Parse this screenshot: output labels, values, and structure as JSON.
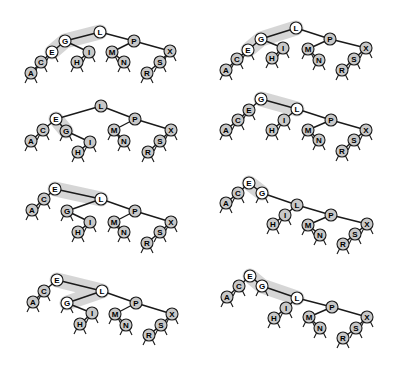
{
  "diagram": {
    "title": "",
    "colors": {
      "node_gray": "#c8c8c8",
      "node_white": "#ffffff",
      "edge": "#1a1a1a",
      "highlight": "#cfcfcf",
      "background": "#ffffff"
    },
    "panels": [
      {
        "id": "panel-1",
        "highlight_path": [
          "E",
          "G",
          "L"
        ],
        "nodes": {
          "L": [
            100,
            32,
            1
          ],
          "G": [
            65,
            41,
            1
          ],
          "E": [
            52,
            52,
            1
          ],
          "C": [
            41,
            62,
            0
          ],
          "A": [
            31,
            73,
            0
          ],
          "I": [
            89,
            52,
            0
          ],
          "H": [
            77,
            62,
            0
          ],
          "P": [
            134,
            41,
            0
          ],
          "M": [
            112,
            52,
            0
          ],
          "N": [
            124,
            62,
            0
          ],
          "X": [
            170,
            51,
            0
          ],
          "S": [
            160,
            62,
            0
          ],
          "R": [
            147,
            73,
            0
          ]
        },
        "edges": [
          [
            "L",
            "G"
          ],
          [
            "G",
            "E"
          ],
          [
            "E",
            "C"
          ],
          [
            "C",
            "A"
          ],
          [
            "G",
            "I"
          ],
          [
            "I",
            "H"
          ],
          [
            "L",
            "P"
          ],
          [
            "P",
            "M"
          ],
          [
            "M",
            "N"
          ],
          [
            "P",
            "X"
          ],
          [
            "X",
            "S"
          ],
          [
            "S",
            "R"
          ]
        ],
        "leaves": [
          "A",
          "C",
          "E",
          "H",
          "I",
          "M",
          "N",
          "R",
          "S",
          "X"
        ]
      },
      {
        "id": "panel-2",
        "highlight_path": [
          "E",
          "G",
          "L"
        ],
        "nodes": {
          "L": [
            296,
            28,
            1
          ],
          "G": [
            261,
            39,
            1
          ],
          "E": [
            248,
            50,
            1
          ],
          "C": [
            237,
            59,
            0
          ],
          "A": [
            226,
            70,
            0
          ],
          "I": [
            283,
            48,
            0
          ],
          "H": [
            272,
            58,
            0
          ],
          "P": [
            330,
            39,
            0
          ],
          "M": [
            308,
            49,
            0
          ],
          "N": [
            319,
            60,
            0
          ],
          "X": [
            366,
            48,
            0
          ],
          "S": [
            354,
            59,
            0
          ],
          "R": [
            342,
            70,
            0
          ]
        },
        "edges": [
          [
            "L",
            "G"
          ],
          [
            "G",
            "E"
          ],
          [
            "E",
            "C"
          ],
          [
            "C",
            "A"
          ],
          [
            "G",
            "I"
          ],
          [
            "I",
            "H"
          ],
          [
            "L",
            "P"
          ],
          [
            "P",
            "M"
          ],
          [
            "M",
            "N"
          ],
          [
            "P",
            "X"
          ],
          [
            "X",
            "S"
          ],
          [
            "S",
            "R"
          ]
        ],
        "leaves": [
          "A",
          "C",
          "E",
          "H",
          "I",
          "M",
          "N",
          "R",
          "S",
          "X"
        ]
      },
      {
        "id": "panel-3",
        "highlight_path": [
          "E",
          "G"
        ],
        "nodes": {
          "L": [
            101,
            106,
            0
          ],
          "E": [
            56,
            119,
            1
          ],
          "C": [
            43,
            130,
            0
          ],
          "A": [
            31,
            141,
            0
          ],
          "G": [
            66,
            131,
            0
          ],
          "I": [
            90,
            142,
            0
          ],
          "H": [
            78,
            152,
            0
          ],
          "P": [
            135,
            119,
            0
          ],
          "M": [
            114,
            130,
            0
          ],
          "N": [
            124,
            141,
            0
          ],
          "X": [
            171,
            130,
            0
          ],
          "S": [
            160,
            141,
            0
          ],
          "R": [
            148,
            152,
            0
          ]
        },
        "edges": [
          [
            "L",
            "E"
          ],
          [
            "E",
            "C"
          ],
          [
            "C",
            "A"
          ],
          [
            "E",
            "G"
          ],
          [
            "G",
            "I"
          ],
          [
            "I",
            "H"
          ],
          [
            "L",
            "P"
          ],
          [
            "P",
            "M"
          ],
          [
            "M",
            "N"
          ],
          [
            "P",
            "X"
          ],
          [
            "X",
            "S"
          ],
          [
            "S",
            "R"
          ]
        ],
        "leaves": [
          "A",
          "C",
          "G",
          "H",
          "I",
          "M",
          "N",
          "R",
          "S",
          "X"
        ]
      },
      {
        "id": "panel-4",
        "highlight_path": [
          "G",
          "L"
        ],
        "nodes": {
          "G": [
            261,
            99,
            1
          ],
          "E": [
            249,
            110,
            0
          ],
          "C": [
            238,
            120,
            0
          ],
          "A": [
            226,
            130,
            0
          ],
          "L": [
            297,
            109,
            1
          ],
          "I": [
            284,
            120,
            0
          ],
          "H": [
            272,
            130,
            0
          ],
          "P": [
            331,
            120,
            0
          ],
          "M": [
            308,
            130,
            0
          ],
          "N": [
            319,
            140,
            0
          ],
          "X": [
            366,
            130,
            0
          ],
          "S": [
            354,
            140,
            0
          ],
          "R": [
            342,
            151,
            0
          ]
        },
        "edges": [
          [
            "G",
            "E"
          ],
          [
            "E",
            "C"
          ],
          [
            "C",
            "A"
          ],
          [
            "G",
            "L"
          ],
          [
            "L",
            "I"
          ],
          [
            "I",
            "H"
          ],
          [
            "L",
            "P"
          ],
          [
            "P",
            "M"
          ],
          [
            "M",
            "N"
          ],
          [
            "P",
            "X"
          ],
          [
            "X",
            "S"
          ],
          [
            "S",
            "R"
          ]
        ],
        "leaves": [
          "A",
          "C",
          "E",
          "H",
          "I",
          "M",
          "N",
          "R",
          "S",
          "X"
        ]
      },
      {
        "id": "panel-5",
        "highlight_path": [
          "E",
          "L"
        ],
        "nodes": {
          "E": [
            55,
            189,
            1
          ],
          "C": [
            44,
            199,
            0
          ],
          "A": [
            32,
            210,
            0
          ],
          "L": [
            101,
            199,
            1
          ],
          "G": [
            67,
            211,
            0
          ],
          "I": [
            90,
            222,
            0
          ],
          "H": [
            78,
            232,
            0
          ],
          "P": [
            135,
            211,
            0
          ],
          "M": [
            114,
            222,
            0
          ],
          "N": [
            124,
            232,
            0
          ],
          "X": [
            171,
            222,
            0
          ],
          "S": [
            160,
            232,
            0
          ],
          "R": [
            147,
            243,
            0
          ]
        },
        "edges": [
          [
            "E",
            "C"
          ],
          [
            "C",
            "A"
          ],
          [
            "E",
            "L"
          ],
          [
            "L",
            "G"
          ],
          [
            "G",
            "I"
          ],
          [
            "I",
            "H"
          ],
          [
            "L",
            "P"
          ],
          [
            "P",
            "M"
          ],
          [
            "M",
            "N"
          ],
          [
            "P",
            "X"
          ],
          [
            "X",
            "S"
          ],
          [
            "S",
            "R"
          ]
        ],
        "leaves": [
          "A",
          "C",
          "G",
          "H",
          "I",
          "M",
          "N",
          "R",
          "S",
          "X"
        ]
      },
      {
        "id": "panel-6",
        "highlight_path": [
          "E",
          "G"
        ],
        "nodes": {
          "E": [
            249,
            183,
            1
          ],
          "C": [
            238,
            193,
            0
          ],
          "A": [
            226,
            203,
            0
          ],
          "G": [
            262,
            193,
            1
          ],
          "L": [
            297,
            205,
            0
          ],
          "I": [
            285,
            215,
            0
          ],
          "H": [
            273,
            224,
            0
          ],
          "P": [
            331,
            215,
            0
          ],
          "M": [
            308,
            225,
            0
          ],
          "N": [
            320,
            235,
            0
          ],
          "X": [
            367,
            224,
            0
          ],
          "S": [
            355,
            234,
            0
          ],
          "R": [
            343,
            244,
            0
          ]
        },
        "edges": [
          [
            "E",
            "C"
          ],
          [
            "C",
            "A"
          ],
          [
            "E",
            "G"
          ],
          [
            "G",
            "L"
          ],
          [
            "L",
            "I"
          ],
          [
            "I",
            "H"
          ],
          [
            "L",
            "P"
          ],
          [
            "P",
            "M"
          ],
          [
            "M",
            "N"
          ],
          [
            "P",
            "X"
          ],
          [
            "X",
            "S"
          ],
          [
            "S",
            "R"
          ]
        ],
        "leaves": [
          "A",
          "C",
          "G",
          "H",
          "I",
          "M",
          "N",
          "R",
          "S",
          "X"
        ]
      },
      {
        "id": "panel-7",
        "highlight_path": [
          "E",
          "L",
          "G"
        ],
        "nodes": {
          "E": [
            57,
            280,
            1
          ],
          "C": [
            44,
            291,
            0
          ],
          "A": [
            33,
            302,
            0
          ],
          "L": [
            102,
            291,
            1
          ],
          "G": [
            67,
            303,
            1
          ],
          "I": [
            92,
            313,
            0
          ],
          "H": [
            80,
            324,
            0
          ],
          "P": [
            136,
            303,
            0
          ],
          "M": [
            115,
            314,
            0
          ],
          "N": [
            126,
            325,
            0
          ],
          "X": [
            172,
            314,
            0
          ],
          "S": [
            161,
            325,
            0
          ],
          "R": [
            149,
            335,
            0
          ]
        },
        "edges": [
          [
            "E",
            "C"
          ],
          [
            "C",
            "A"
          ],
          [
            "E",
            "L"
          ],
          [
            "L",
            "G"
          ],
          [
            "G",
            "I"
          ],
          [
            "I",
            "H"
          ],
          [
            "L",
            "P"
          ],
          [
            "P",
            "M"
          ],
          [
            "M",
            "N"
          ],
          [
            "P",
            "X"
          ],
          [
            "X",
            "S"
          ],
          [
            "S",
            "R"
          ]
        ],
        "leaves": [
          "A",
          "C",
          "G",
          "H",
          "I",
          "M",
          "N",
          "R",
          "S",
          "X"
        ]
      },
      {
        "id": "panel-8",
        "highlight_path": [
          "E",
          "G",
          "L"
        ],
        "nodes": {
          "E": [
            250,
            276,
            1
          ],
          "C": [
            239,
            286,
            0
          ],
          "A": [
            227,
            297,
            0
          ],
          "G": [
            262,
            286,
            1
          ],
          "L": [
            297,
            298,
            1
          ],
          "I": [
            286,
            308,
            0
          ],
          "H": [
            274,
            318,
            0
          ],
          "P": [
            332,
            307,
            0
          ],
          "M": [
            309,
            317,
            0
          ],
          "N": [
            320,
            328,
            0
          ],
          "X": [
            367,
            317,
            0
          ],
          "S": [
            356,
            328,
            0
          ],
          "R": [
            343,
            338,
            0
          ]
        },
        "edges": [
          [
            "E",
            "C"
          ],
          [
            "C",
            "A"
          ],
          [
            "E",
            "G"
          ],
          [
            "G",
            "L"
          ],
          [
            "L",
            "I"
          ],
          [
            "I",
            "H"
          ],
          [
            "L",
            "P"
          ],
          [
            "P",
            "M"
          ],
          [
            "M",
            "N"
          ],
          [
            "P",
            "X"
          ],
          [
            "X",
            "S"
          ],
          [
            "S",
            "R"
          ]
        ],
        "leaves": [
          "A",
          "C",
          "G",
          "H",
          "I",
          "M",
          "N",
          "R",
          "S",
          "X"
        ]
      }
    ]
  }
}
